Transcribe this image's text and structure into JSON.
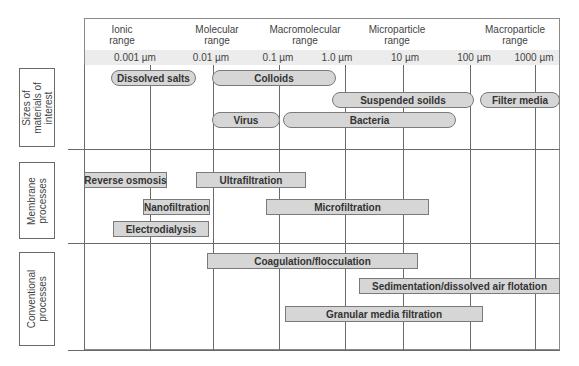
{
  "ranges": [
    {
      "label": "Ionic\nrange",
      "line1": "Ionic",
      "line2": "range"
    },
    {
      "label": "Molecular\nrange",
      "line1": "Molecular",
      "line2": "range"
    },
    {
      "label": "Macromolecular\nrange",
      "line1": "Macromolecular",
      "line2": "range"
    },
    {
      "label": "Microparticle\nrange",
      "line1": "Microparticle",
      "line2": "range"
    },
    {
      "label": "Macroparticle\nrange",
      "line1": "Macroparticle",
      "line2": "range"
    }
  ],
  "scale": {
    "ticks": [
      "0.001 µm",
      "0.01 µm",
      "0.1 µm",
      "1.0 µm",
      "10 µm",
      "100 µm",
      "1000 µm"
    ],
    "band_color": "#ececec"
  },
  "sections": [
    {
      "id": "materials",
      "line1": "Sizes of",
      "line2": "materials of",
      "line3": "interest"
    },
    {
      "id": "membrane",
      "line1": "Membrane",
      "line2": "processes"
    },
    {
      "id": "conventional",
      "line1": "Conventional",
      "line2": "processes"
    }
  ],
  "materials": [
    {
      "label": "Dissolved salts"
    },
    {
      "label": "Colloids"
    },
    {
      "label": "Suspended soilds"
    },
    {
      "label": "Filter media"
    },
    {
      "label": "Virus"
    },
    {
      "label": "Bacteria"
    }
  ],
  "membrane": [
    {
      "label": "Reverse osmosis"
    },
    {
      "label": "Ultrafiltration"
    },
    {
      "label": "Nanofiltration"
    },
    {
      "label": "Microfiltration"
    },
    {
      "label": "Electrodialysis"
    }
  ],
  "conventional": [
    {
      "label": "Coagulation/flocculation"
    },
    {
      "label": "Sedimentation/dissolved air flotation"
    },
    {
      "label": "Granular media filtration"
    }
  ],
  "colors": {
    "shape_fill": "#d6d6d6",
    "shape_border": "#7a7a7a",
    "grid_line": "#6a6a6a"
  }
}
